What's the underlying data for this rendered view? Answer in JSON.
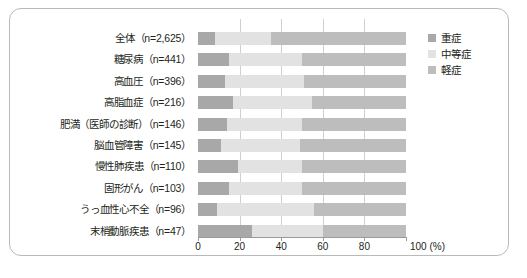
{
  "legend": {
    "position": "top-right",
    "items": [
      {
        "label": "重症",
        "color": "#a8a8a8",
        "icon": "legend-swatch-severe"
      },
      {
        "label": "中等症",
        "color": "#e2e2e2",
        "icon": "legend-swatch-moderate"
      },
      {
        "label": "軽症",
        "color": "#bdbdbd",
        "icon": "legend-swatch-mild"
      }
    ]
  },
  "axis": {
    "unit": "100 (%)",
    "ticks": [
      {
        "value": 0,
        "label": "0"
      },
      {
        "value": 20,
        "label": "20"
      },
      {
        "value": 40,
        "label": "40"
      },
      {
        "value": 60,
        "label": "60"
      },
      {
        "value": 80,
        "label": "80"
      },
      {
        "value": 100,
        "label": "100"
      }
    ]
  },
  "chart_data": {
    "type": "bar",
    "orientation": "horizontal",
    "stacked": true,
    "normalized": true,
    "title": "",
    "xlabel": "100 (%)",
    "ylabel": "",
    "xlim": [
      0,
      100
    ],
    "grid": true,
    "legend_position": "top-right",
    "categories": [
      "全体（n=2,625）",
      "糖尿病（n=441）",
      "高血圧（n=396）",
      "高脂血症（n=216）",
      "肥満（医師の診断）（n=146）",
      "脳血管障害（n=145）",
      "慢性肺疾患（n=110）",
      "固形がん（n=103）",
      "うっ血性心不全（n=96）",
      "末梢動脈疾患（n=47）"
    ],
    "series": [
      {
        "name": "重症",
        "color": "#a8a8a8",
        "values": [
          8,
          15,
          13,
          17,
          14,
          11,
          19,
          15,
          9,
          26
        ]
      },
      {
        "name": "中等症",
        "color": "#e2e2e2",
        "values": [
          27,
          35,
          38,
          38,
          36,
          38,
          31,
          35,
          47,
          34
        ]
      },
      {
        "name": "軽症",
        "color": "#bdbdbd",
        "values": [
          65,
          50,
          49,
          45,
          50,
          51,
          50,
          50,
          44,
          40
        ]
      }
    ]
  }
}
